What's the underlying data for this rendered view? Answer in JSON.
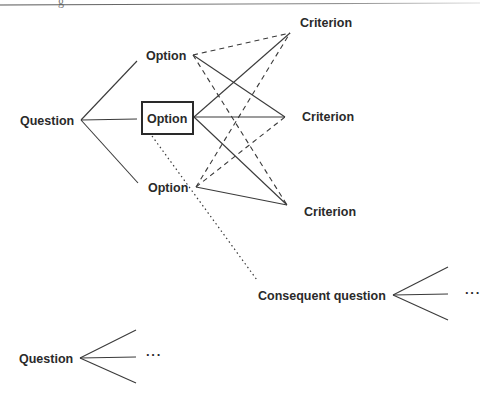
{
  "header_fragment": "g",
  "labels": {
    "question_main": "Question",
    "option_top": "Option",
    "option_selected": "Option",
    "option_bottom": "Option",
    "criterion_top": "Criterion",
    "criterion_mid": "Criterion",
    "criterion_bottom": "Criterion",
    "consequent_question": "Consequent question",
    "question_second": "Question",
    "ellipsis_consequent": "···",
    "ellipsis_second": "···"
  },
  "edges": {
    "solid": [
      [
        "Question",
        "Option top"
      ],
      [
        "Question",
        "Option selected"
      ],
      [
        "Question",
        "Option bottom"
      ],
      [
        "Option top",
        "Criterion mid"
      ],
      [
        "Option selected",
        "Criterion top"
      ],
      [
        "Option selected",
        "Criterion mid"
      ],
      [
        "Option selected",
        "Criterion bottom"
      ],
      [
        "Option bottom",
        "Criterion bottom"
      ]
    ],
    "dashed": [
      [
        "Option top",
        "Criterion top"
      ],
      [
        "Option top",
        "Criterion bottom"
      ],
      [
        "Option bottom",
        "Criterion top"
      ],
      [
        "Option bottom",
        "Criterion mid"
      ]
    ],
    "dotted": [
      [
        "Option selected",
        "Consequent question"
      ]
    ]
  },
  "colors": {
    "line": "#3a3a3a",
    "text": "#2a2a2a",
    "background": "#ffffff"
  }
}
